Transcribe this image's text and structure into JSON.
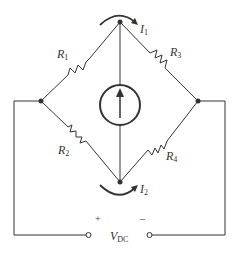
{
  "diagram": {
    "type": "circuit",
    "labels": {
      "R1": {
        "main": "R",
        "sub": "1"
      },
      "R2": {
        "main": "R",
        "sub": "2"
      },
      "R3": {
        "main": "R",
        "sub": "3"
      },
      "R4": {
        "main": "R",
        "sub": "4"
      },
      "I1": {
        "main": "I",
        "sub": "1"
      },
      "I2": {
        "main": "I",
        "sub": "2"
      },
      "VDC": {
        "main": "V",
        "sub": "DC"
      },
      "plus": "+",
      "minus": "–"
    },
    "components": [
      {
        "id": "R1",
        "type": "resistor",
        "between": [
          "left-node",
          "top-node"
        ]
      },
      {
        "id": "R3",
        "type": "resistor",
        "between": [
          "top-node",
          "right-node"
        ]
      },
      {
        "id": "R2",
        "type": "resistor",
        "between": [
          "left-node",
          "bottom-node"
        ]
      },
      {
        "id": "R4",
        "type": "resistor",
        "between": [
          "bottom-node",
          "right-node"
        ]
      },
      {
        "id": "current-source",
        "type": "current-source",
        "between": [
          "bottom-node",
          "top-node"
        ],
        "direction": "up"
      },
      {
        "id": "VDC",
        "type": "voltage-terminals",
        "polarity": [
          "+",
          "-"
        ]
      }
    ],
    "colors": {
      "line": "#333333",
      "background": "#ffffff"
    }
  }
}
